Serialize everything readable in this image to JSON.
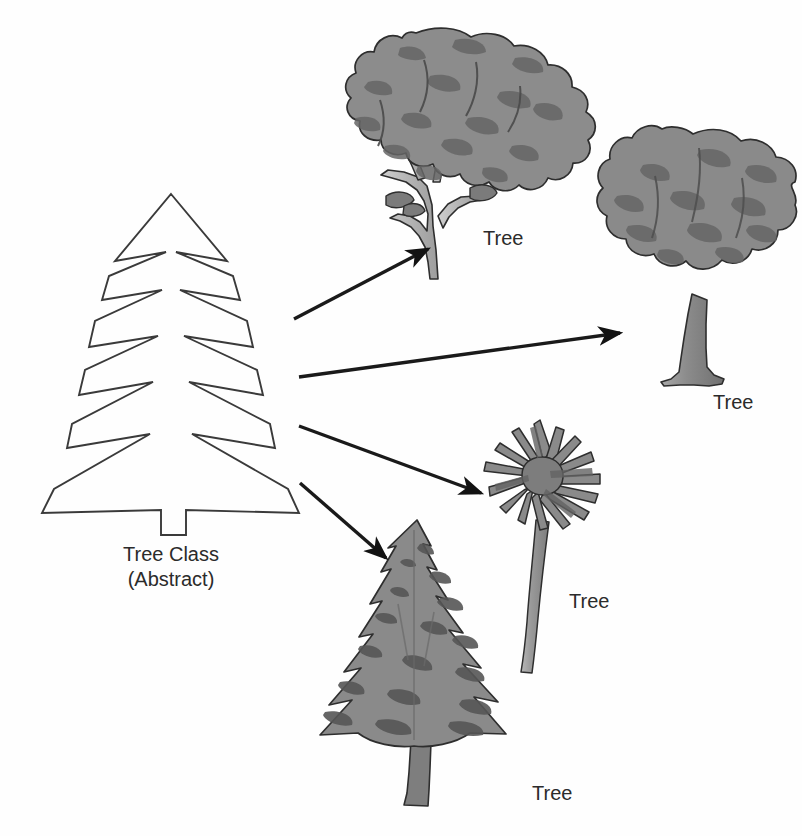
{
  "diagram": {
    "background_color": "#fefefe",
    "width": 802,
    "height": 836,
    "abstract_node": {
      "name": "tree-class-abstract",
      "label_line1": "Tree Class",
      "label_line2": "(Abstract)",
      "shape": "conifer-outline",
      "stroke_color": "#3a3a3a",
      "fill_color": "none",
      "label_x": 171,
      "label_y1": 561,
      "label_y2": 586
    },
    "instances": [
      {
        "name": "deciduous-broadleaf-tree",
        "label": "Tree",
        "label_x": 483,
        "label_y": 245,
        "canopy_color": "#8d8d8d",
        "canopy_shade_color": "#6d6d6d",
        "trunk_color": "#b4b4b4",
        "outline_color": "#2e2e2e"
      },
      {
        "name": "round-canopy-tree",
        "label": "Tree",
        "label_x": 713,
        "label_y": 409,
        "canopy_color": "#8a8a8a",
        "canopy_shade_color": "#6a6a6a",
        "trunk_color": "#8f8f8f",
        "outline_color": "#2e2e2e"
      },
      {
        "name": "palm-tree",
        "label": "Tree",
        "label_x": 569,
        "label_y": 608,
        "canopy_color": "#8a8a8a",
        "canopy_shade_color": "#6a6a6a",
        "trunk_color": "#9d9d9d",
        "outline_color": "#2e2e2e"
      },
      {
        "name": "pine-fir-tree",
        "label": "Tree",
        "label_x": 532,
        "label_y": 800,
        "canopy_color": "#8a8a8a",
        "canopy_shade_color": "#5f5f5f",
        "trunk_color": "#7e7e7e",
        "outline_color": "#2e2e2e"
      }
    ],
    "arrows": [
      {
        "name": "arrow-to-deciduous-broadleaf-tree",
        "from_x": 294,
        "from_y": 319,
        "to_x": 428,
        "to_y": 249,
        "color": "#121212"
      },
      {
        "name": "arrow-to-round-canopy-tree",
        "from_x": 299,
        "from_y": 377,
        "to_x": 620,
        "to_y": 333,
        "color": "#121212"
      },
      {
        "name": "arrow-to-palm-tree",
        "from_x": 299,
        "from_y": 426,
        "to_x": 481,
        "to_y": 493,
        "color": "#121212"
      },
      {
        "name": "arrow-to-pine-fir-tree",
        "from_x": 300,
        "from_y": 483,
        "to_x": 386,
        "to_y": 558,
        "color": "#121212"
      }
    ]
  }
}
